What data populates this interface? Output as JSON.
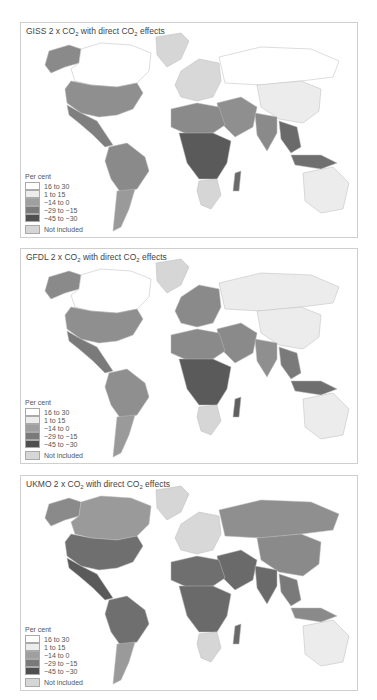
{
  "legend": {
    "title": "Per cent",
    "items": [
      {
        "label": "16 to 30",
        "color": "#ffffff"
      },
      {
        "label": "1 to 15",
        "color": "#ececec"
      },
      {
        "label": "−14 to 0",
        "color": "#9f9f9f"
      },
      {
        "label": "−29 to −15",
        "color": "#7a7a7a"
      },
      {
        "label": "−45 to −30",
        "color": "#4f4f4f"
      }
    ],
    "not_included": {
      "label": "Not included",
      "color": "#d6d6d6"
    }
  },
  "panels": [
    {
      "model": "GISS",
      "title_prefix": "GISS 2 x CO",
      "title_mid": " with direct CO",
      "title_suffix": " effects",
      "regions": {
        "canada": "#ffffff",
        "alaska": "#8a8a8a",
        "greenland": "#d6d6d6",
        "usa": "#8f8f8f",
        "mexico_central": "#7f7f7f",
        "south_america_north": "#8a8a8a",
        "south_america_south": "#9a9a9a",
        "europe": "#d8d8d8",
        "russia": "#ffffff",
        "china": "#ececec",
        "middle_east": "#8f8f8f",
        "north_africa": "#8a8a8a",
        "central_africa": "#5a5a5a",
        "southern_africa": "#d6d6d6",
        "india": "#8a8a8a",
        "southeast_asia": "#6a6a6a",
        "australia": "#ececec",
        "indonesia": "#6f6f6f",
        "madagascar": "#6a6a6a"
      }
    },
    {
      "model": "GFDL",
      "title_prefix": "GFDL 2 x CO",
      "title_mid": " with direct CO",
      "title_suffix": " effects",
      "regions": {
        "canada": "#ffffff",
        "alaska": "#8a8a8a",
        "greenland": "#d6d6d6",
        "usa": "#8f8f8f",
        "mexico_central": "#7a7a7a",
        "south_america_north": "#8f8f8f",
        "south_america_south": "#9a9a9a",
        "europe": "#8a8a8a",
        "russia": "#ececec",
        "china": "#ececec",
        "middle_east": "#8a8a8a",
        "north_africa": "#8a8a8a",
        "central_africa": "#5a5a5a",
        "southern_africa": "#d6d6d6",
        "india": "#8f8f8f",
        "southeast_asia": "#7a7a7a",
        "australia": "#ececec",
        "indonesia": "#6f6f6f",
        "madagascar": "#5f5f5f"
      }
    },
    {
      "model": "UKMO",
      "title_prefix": "UKMO 2 x CO",
      "title_mid": " with direct CO",
      "title_suffix": " effects",
      "regions": {
        "canada": "#9a9a9a",
        "alaska": "#8a8a8a",
        "greenland": "#d6d6d6",
        "usa": "#6f6f6f",
        "mexico_central": "#5a5a5a",
        "south_america_north": "#6f6f6f",
        "south_america_south": "#9a9a9a",
        "europe": "#d8d8d8",
        "russia": "#8f8f8f",
        "china": "#8a8a8a",
        "middle_east": "#6a6a6a",
        "north_africa": "#6f6f6f",
        "central_africa": "#6a6a6a",
        "southern_africa": "#d6d6d6",
        "india": "#6a6a6a",
        "southeast_asia": "#7a7a7a",
        "australia": "#ececec",
        "indonesia": "#8a8a8a",
        "madagascar": "#6a6a6a"
      }
    }
  ],
  "chart_data": [
    {
      "type": "heatmap",
      "title": "GISS 2 x CO2 with direct CO2 effects",
      "legend_title": "Per cent",
      "legend": [
        "16 to 30",
        "1 to 15",
        "-14 to 0",
        "-29 to -15",
        "-45 to -30",
        "Not included"
      ],
      "regions": {
        "Canada/Russia": "16 to 30",
        "China/Australia": "1 to 15",
        "USA": "-14 to 0",
        "Central Africa": "-45 to -30",
        "South Asia": "-29 to -15",
        "Southern Africa": "Not included",
        "Greenland": "Not included"
      }
    },
    {
      "type": "heatmap",
      "title": "GFDL 2 x CO2 with direct CO2 effects",
      "legend_title": "Per cent",
      "legend": [
        "16 to 30",
        "1 to 15",
        "-14 to 0",
        "-29 to -15",
        "-45 to -30",
        "Not included"
      ],
      "regions": {
        "Canada": "16 to 30",
        "Russia/China/Australia": "1 to 15",
        "USA/Europe": "-14 to 0",
        "Central Africa": "-45 to -30",
        "Southern Africa": "Not included",
        "Greenland": "Not included"
      }
    },
    {
      "type": "heatmap",
      "title": "UKMO 2 x CO2 with direct CO2 effects",
      "legend_title": "Per cent",
      "legend": [
        "16 to 30",
        "1 to 15",
        "-14 to 0",
        "-29 to -15",
        "-45 to -30",
        "Not included"
      ],
      "regions": {
        "Canada/Russia": "-14 to 0",
        "USA/Brazil": "-29 to -15",
        "Mexico/Egypt/Pakistan": "-45 to -30",
        "Australia/Europe": "1 to 15",
        "Southern Africa": "Not included",
        "Greenland": "Not included"
      }
    }
  ]
}
